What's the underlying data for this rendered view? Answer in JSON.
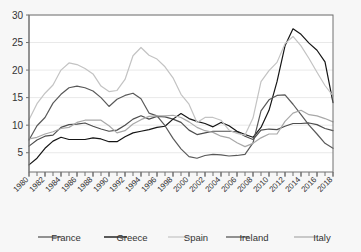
{
  "chart_data": {
    "type": "line",
    "title": "",
    "subtitle": "",
    "xlabel": "",
    "ylabel": "",
    "xlim": [
      1980,
      2018
    ],
    "ylim": [
      1.5,
      30
    ],
    "grid": true,
    "legend_position": "bottom",
    "yticks": [
      5,
      10,
      15,
      20,
      25,
      30
    ],
    "ytick_labels": [
      "5",
      "10",
      "15",
      "20",
      "25",
      "30"
    ],
    "x": [
      1980,
      1981,
      1982,
      1983,
      1984,
      1985,
      1986,
      1987,
      1988,
      1989,
      1990,
      1991,
      1992,
      1993,
      1994,
      1995,
      1996,
      1997,
      1998,
      1999,
      2000,
      2001,
      2002,
      2003,
      2004,
      2005,
      2006,
      2007,
      2008,
      2009,
      2010,
      2011,
      2012,
      2013,
      2014,
      2015,
      2016,
      2017,
      2018
    ],
    "xtick_values": [
      1980,
      1982,
      1984,
      1986,
      1988,
      1990,
      1992,
      1994,
      1996,
      1998,
      2000,
      2002,
      2004,
      2006,
      2008,
      2010,
      2012,
      2014,
      2016,
      2018
    ],
    "xtick_labels": [
      "1980",
      "1982",
      "1984",
      "1986",
      "1988",
      "1990",
      "1992",
      "1994",
      "1996",
      "1998",
      "2000",
      "2002",
      "2004",
      "2006",
      "2008",
      "2010",
      "2012",
      "2014",
      "2016",
      "2018"
    ],
    "xminor_step": 1,
    "series": [
      {
        "name": "France",
        "color": "#4d4d4d",
        "values": [
          6.2,
          7.3,
          8.0,
          8.2,
          9.6,
          10.1,
          10.2,
          10.4,
          9.8,
          9.3,
          8.9,
          9.1,
          10.0,
          11.1,
          11.7,
          11.1,
          11.6,
          11.5,
          11.1,
          10.5,
          9.1,
          8.3,
          8.6,
          8.9,
          8.9,
          8.9,
          8.8,
          8.0,
          7.4,
          9.1,
          9.3,
          9.2,
          9.8,
          10.3,
          10.3,
          10.4,
          10.1,
          9.4,
          9.0
        ],
        "linewidth": 1.2
      },
      {
        "name": "Greece",
        "color": "#151515",
        "values": [
          2.8,
          4.0,
          5.8,
          7.1,
          7.8,
          7.4,
          7.4,
          7.4,
          7.7,
          7.5,
          7.0,
          7.0,
          7.9,
          8.6,
          8.9,
          9.2,
          9.6,
          9.8,
          11.1,
          12.1,
          11.2,
          10.7,
          10.3,
          9.7,
          10.5,
          9.9,
          8.9,
          8.3,
          7.8,
          9.6,
          12.7,
          17.9,
          24.4,
          27.5,
          26.5,
          24.9,
          23.6,
          21.5,
          14.1
        ],
        "linewidth": 1.4
      },
      {
        "name": "Spain",
        "color": "#c3c3c3",
        "values": [
          11.0,
          13.9,
          15.8,
          17.3,
          20.0,
          21.3,
          21.0,
          20.3,
          19.3,
          17.1,
          16.1,
          16.3,
          18.3,
          22.6,
          24.1,
          22.7,
          22.0,
          20.6,
          18.6,
          15.6,
          13.8,
          10.5,
          11.4,
          11.4,
          10.9,
          9.1,
          8.5,
          8.2,
          11.3,
          17.9,
          19.9,
          21.4,
          24.8,
          26.1,
          24.4,
          22.1,
          19.6,
          17.2,
          15.3
        ],
        "linewidth": 1.2
      },
      {
        "name": "Ireland",
        "color": "#595959",
        "values": [
          7.3,
          9.9,
          11.4,
          14.0,
          15.6,
          16.8,
          17.1,
          16.8,
          16.2,
          15.0,
          13.4,
          14.7,
          15.4,
          15.8,
          14.8,
          12.2,
          11.7,
          9.9,
          7.6,
          5.7,
          4.3,
          4.0,
          4.5,
          4.7,
          4.6,
          4.4,
          4.5,
          4.7,
          6.8,
          12.6,
          14.6,
          15.4,
          15.5,
          13.8,
          11.9,
          10.0,
          8.4,
          6.7,
          5.8
        ],
        "linewidth": 1.3
      },
      {
        "name": "Italy",
        "color": "#a8a8a8",
        "values": [
          7.5,
          7.8,
          8.4,
          8.8,
          9.4,
          9.6,
          10.5,
          10.9,
          10.9,
          10.9,
          9.9,
          8.6,
          9.0,
          10.2,
          11.0,
          11.6,
          11.7,
          11.7,
          11.8,
          11.4,
          10.6,
          9.6,
          9.0,
          8.7,
          8.0,
          7.7,
          6.8,
          6.1,
          6.7,
          7.7,
          8.4,
          8.4,
          10.7,
          12.2,
          12.7,
          11.9,
          11.7,
          11.2,
          10.6
        ],
        "linewidth": 1.2
      }
    ]
  },
  "legend": {
    "entries": [
      {
        "label": "France",
        "color": "#4d4d4d"
      },
      {
        "label": "Greece",
        "color": "#151515"
      },
      {
        "label": "Spain",
        "color": "#c3c3c3"
      },
      {
        "label": "Ireland",
        "color": "#595959"
      },
      {
        "label": "Italy",
        "color": "#a8a8a8"
      }
    ]
  }
}
